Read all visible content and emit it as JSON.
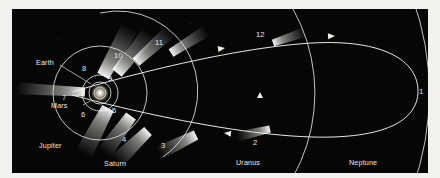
{
  "figure": {
    "medium": "halftone print plate",
    "background_color": "#060606",
    "ink_color": "#e9e9e4",
    "page_color": "#f2f1ee"
  },
  "sun": {
    "label": "Sun",
    "x": 88,
    "y": 93
  },
  "planet_orbits": [
    {
      "name": "Earth",
      "label": "Earth",
      "type": "circle",
      "cx": 88,
      "cy": 93,
      "r": 11,
      "label_x": 36,
      "label_y": 63,
      "leader": [
        48,
        65,
        79,
        84
      ]
    },
    {
      "name": "Mars",
      "label": "Mars",
      "type": "circle",
      "cx": 88,
      "cy": 93,
      "r": 18,
      "label_x": 51,
      "label_y": 108,
      "leader": [
        71,
        105,
        80,
        100
      ]
    },
    {
      "name": "Jupiter",
      "label": "Jupiter",
      "type": "circle",
      "cx": 88,
      "cy": 93,
      "r": 47,
      "label_x": 39,
      "label_y": 148,
      "leader": null
    },
    {
      "name": "Saturn",
      "label": "Saturn",
      "type": "arc",
      "cx": 88,
      "cy": 93,
      "r": 80,
      "label_x": 104,
      "label_y": 160,
      "leader": null
    },
    {
      "name": "Uranus",
      "label": "Uranus",
      "type": "arc",
      "cx": 88,
      "cy": 93,
      "r": 172,
      "label_x": 236,
      "label_y": 163,
      "leader": null
    },
    {
      "name": "Neptune",
      "label": "Neptune",
      "type": "arc",
      "cx": 88,
      "cy": 93,
      "r": 278,
      "label_x": 349,
      "label_y": 163,
      "leader": null
    }
  ],
  "comet_positions": [
    {
      "id": "1",
      "label": "1",
      "x": 413,
      "y": 90,
      "label_x": 419,
      "label_y": 92,
      "tail": null
    },
    {
      "id": "2",
      "label": "2",
      "x": 258,
      "y": 129,
      "label_x": 253,
      "label_y": 142,
      "tail": {
        "angle": 167,
        "length": 34,
        "width": 7
      }
    },
    {
      "id": "3",
      "label": "3",
      "x": 184,
      "y": 135,
      "label_x": 161,
      "label_y": 146,
      "tail": {
        "angle": 154,
        "length": 42,
        "width": 10
      }
    },
    {
      "id": "4",
      "label": "4",
      "x": 136,
      "y": 131,
      "label_x": 122,
      "label_y": 141,
      "tail": {
        "angle": 136,
        "length": 44,
        "width": 11
      }
    },
    {
      "id": "5",
      "label": "5",
      "x": 119,
      "y": 116,
      "label_x": 112,
      "label_y": 112,
      "tail": {
        "angle": 126,
        "length": 46,
        "width": 12
      }
    },
    {
      "id": "6",
      "label": "6",
      "x": 96,
      "y": 108,
      "label_x": 81,
      "label_y": 117,
      "tail": {
        "angle": 118,
        "length": 52,
        "width": 13
      }
    },
    {
      "id": "7",
      "label": "7",
      "x": 73,
      "y": 92,
      "label_x": 62,
      "label_y": 100,
      "tail": {
        "angle": 183,
        "length": 70,
        "width": 9
      }
    },
    {
      "id": "8",
      "label": "8",
      "x": 91,
      "y": 76,
      "label_x": 82,
      "label_y": 70,
      "tail": {
        "angle": 299,
        "length": 56,
        "width": 13
      }
    },
    {
      "id": "9",
      "label": "9",
      "x": 105,
      "y": 73,
      "label_x": 108,
      "label_y": 80,
      "tail": {
        "angle": 309,
        "length": 52,
        "width": 12
      }
    },
    {
      "id": "10",
      "label": "10",
      "x": 124,
      "y": 62,
      "label_x": 114,
      "label_y": 57,
      "tail": {
        "angle": 318,
        "length": 46,
        "width": 10
      }
    },
    {
      "id": "11",
      "label": "11",
      "x": 159,
      "y": 53,
      "label_x": 155,
      "label_y": 44,
      "tail": {
        "angle": 328,
        "length": 42,
        "width": 9
      }
    },
    {
      "id": "12",
      "label": "12",
      "x": 261,
      "y": 43,
      "label_x": 256,
      "label_y": 36,
      "tail": {
        "angle": 341,
        "length": 34,
        "width": 7
      }
    }
  ],
  "direction_arrows": [
    {
      "name": "outbound-arrow-upper",
      "x": 213,
      "y": 48,
      "angle": -8
    },
    {
      "name": "outbound-arrow-far",
      "x": 323,
      "y": 36,
      "angle": -3
    },
    {
      "name": "inbound-arrow-lower",
      "x": 212,
      "y": 133,
      "angle": 186
    },
    {
      "name": "inbound-arrow-orbit",
      "x": 258,
      "y": 92,
      "angle": 270
    }
  ]
}
